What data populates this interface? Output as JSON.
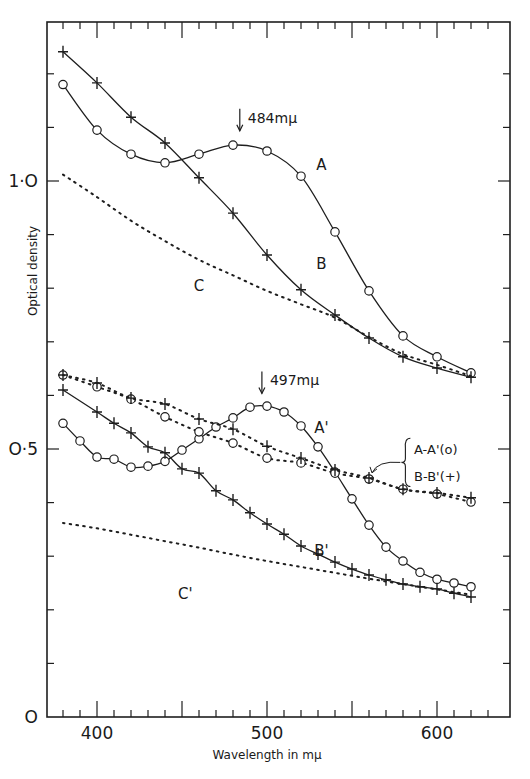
{
  "chart_data": {
    "type": "line",
    "title": "",
    "xlabel": "Wavelength in mμ",
    "ylabel": "Optical density",
    "xlim": [
      370,
      640
    ],
    "ylim": [
      0,
      1.3
    ],
    "x_ticks_labeled": [
      400,
      500,
      600
    ],
    "y_ticks_labeled": [
      {
        "value": 0,
        "label": "O"
      },
      {
        "value": 0.5,
        "label": "O·5"
      },
      {
        "value": 1.0,
        "label": "1·O"
      }
    ],
    "grid": false,
    "legend_position": "inline labels",
    "series": [
      {
        "name": "A",
        "marker": "circle",
        "line": "solid",
        "x": [
          380,
          400,
          420,
          440,
          460,
          480,
          500,
          520,
          540,
          560,
          580,
          600,
          620
        ],
        "y": [
          1.18,
          1.095,
          1.05,
          1.034,
          1.05,
          1.067,
          1.056,
          1.009,
          0.905,
          0.795,
          0.711,
          0.672,
          0.642
        ]
      },
      {
        "name": "B",
        "marker": "plus",
        "line": "solid",
        "x": [
          380,
          400,
          420,
          440,
          460,
          480,
          500,
          520,
          540,
          560,
          580,
          600,
          620
        ],
        "y": [
          1.241,
          1.183,
          1.119,
          1.071,
          1.006,
          0.94,
          0.862,
          0.797,
          0.75,
          0.707,
          0.672,
          0.651,
          0.634
        ]
      },
      {
        "name": "C",
        "marker": "none",
        "line": "dotted",
        "x": [
          380,
          400,
          420,
          440,
          460,
          480,
          500,
          520,
          540,
          560,
          580,
          600,
          620
        ],
        "y": [
          1.012,
          0.97,
          0.926,
          0.888,
          0.853,
          0.824,
          0.795,
          0.77,
          0.745,
          0.709,
          0.677,
          0.657,
          0.636
        ]
      },
      {
        "name": "A'",
        "marker": "circle",
        "line": "solid",
        "x": [
          380,
          390,
          400,
          410,
          420,
          430,
          440,
          450,
          460,
          470,
          480,
          490,
          500,
          510,
          520,
          530,
          540,
          550,
          560,
          570,
          580,
          590,
          600,
          610,
          620
        ],
        "y": [
          0.548,
          0.515,
          0.485,
          0.481,
          0.466,
          0.468,
          0.477,
          0.498,
          0.519,
          0.541,
          0.558,
          0.578,
          0.58,
          0.569,
          0.543,
          0.504,
          0.457,
          0.407,
          0.358,
          0.317,
          0.291,
          0.27,
          0.257,
          0.25,
          0.243
        ]
      },
      {
        "name": "B'",
        "marker": "plus",
        "line": "solid",
        "x": [
          380,
          400,
          410,
          420,
          430,
          440,
          450,
          460,
          470,
          480,
          490,
          500,
          510,
          520,
          530,
          540,
          550,
          560,
          570,
          580,
          590,
          600,
          610,
          620
        ],
        "y": [
          0.61,
          0.569,
          0.548,
          0.53,
          0.504,
          0.493,
          0.463,
          0.455,
          0.422,
          0.405,
          0.381,
          0.36,
          0.341,
          0.319,
          0.304,
          0.289,
          0.276,
          0.265,
          0.256,
          0.248,
          0.243,
          0.239,
          0.231,
          0.224
        ]
      },
      {
        "name": "C'",
        "marker": "none",
        "line": "dotted",
        "x": [
          380,
          400,
          420,
          440,
          460,
          480,
          500,
          520,
          540,
          560,
          580,
          600,
          620
        ],
        "y": [
          0.362,
          0.352,
          0.34,
          0.328,
          0.316,
          0.303,
          0.291,
          0.28,
          0.269,
          0.258,
          0.248,
          0.238,
          0.228
        ]
      },
      {
        "name": "A-A' (o)",
        "marker": "circle",
        "line": "dotted",
        "x": [
          380,
          400,
          420,
          440,
          460,
          480,
          500,
          520,
          540,
          560,
          580,
          600,
          620
        ],
        "y": [
          0.638,
          0.616,
          0.593,
          0.56,
          0.532,
          0.511,
          0.483,
          0.474,
          0.455,
          0.444,
          0.425,
          0.416,
          0.401
        ]
      },
      {
        "name": "B-B' (+)",
        "marker": "plus",
        "line": "dotted",
        "x": [
          380,
          400,
          420,
          440,
          460,
          480,
          500,
          520,
          540,
          560,
          580,
          600,
          620
        ],
        "y": [
          0.638,
          0.623,
          0.595,
          0.584,
          0.556,
          0.537,
          0.505,
          0.483,
          0.461,
          0.446,
          0.425,
          0.418,
          0.409
        ]
      }
    ],
    "annotations": [
      {
        "text": "484mμ",
        "x": 484,
        "arrow_to_y": 1.075
      },
      {
        "text": "497mμ",
        "x": 497,
        "arrow_to_y": 0.585
      },
      {
        "text": "A",
        "x": 532,
        "y": 1.02
      },
      {
        "text": "B",
        "x": 532,
        "y": 0.835
      },
      {
        "text": "C",
        "x": 460,
        "y": 0.795
      },
      {
        "text": "A'",
        "x": 532,
        "y": 0.53
      },
      {
        "text": "B'",
        "x": 532,
        "y": 0.3
      },
      {
        "text": "C'",
        "x": 452,
        "y": 0.22
      },
      {
        "text": "A-A'(o)",
        "x": 590,
        "y": 0.5
      },
      {
        "text": "B-B'(+)",
        "x": 590,
        "y": 0.45
      }
    ]
  }
}
